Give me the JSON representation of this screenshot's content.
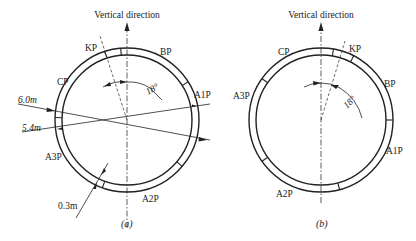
{
  "figure_a": {
    "caption": "(a)",
    "vertical_label": "Vertical direction",
    "angle_label": "18°",
    "segments": [
      "KP",
      "BP",
      "A1P",
      "A2P",
      "A3P",
      "CP"
    ],
    "labels": {
      "kp": "KP",
      "bp": "BP",
      "a1p": "A1P",
      "a2p": "A2P",
      "a3p": "A3P",
      "cp": "CP"
    },
    "dimensions": {
      "outer_diameter": "6.0m",
      "inner_diameter": "5.4m",
      "thickness": "0.3m"
    }
  },
  "figure_b": {
    "caption": "(b)",
    "vertical_label": "Vertical direction",
    "angle_label": "18°",
    "segments": [
      "KP",
      "BP",
      "A1P",
      "A2P",
      "A3P",
      "CP"
    ],
    "labels": {
      "kp": "KP",
      "bp": "BP",
      "a1p": "A1P",
      "a2p": "A2P",
      "a3p": "A3P",
      "cp": "CP"
    }
  },
  "colors": {
    "line": "#222222",
    "background": "#ffffff"
  }
}
